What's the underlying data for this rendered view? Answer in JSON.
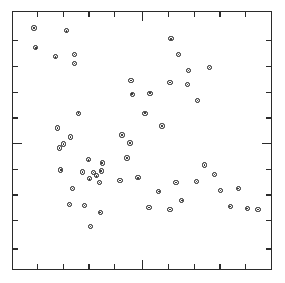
{
  "chart_data": {
    "type": "scatter",
    "title": "",
    "subtitle": "",
    "xlabel": "",
    "ylabel": "",
    "xlim": [
      0,
      100
    ],
    "ylim": [
      0,
      100
    ],
    "grid": false,
    "legend": null,
    "annotations": [],
    "marker": {
      "shape": "circle-open-with-center-dot",
      "color": "#1a1a1a",
      "fill": "#ffffff",
      "size_px": 5.4
    },
    "axes": {
      "frame": "full-box",
      "tick_direction": "inward",
      "tick_labels_shown": false,
      "x_tick_positions": [
        9.2,
        19.2,
        29.2,
        39.2,
        50.0,
        60.0,
        70.0,
        80.0,
        90.0
      ],
      "x_major_tick_positions": [
        50.0
      ],
      "y_tick_positions": [
        8.0,
        19.0,
        29.0,
        39.0,
        49.0,
        59.0,
        69.0,
        79.0,
        89.0
      ],
      "y_major_tick_positions": [
        49.0
      ]
    },
    "n_points": 55,
    "points": [
      {
        "x": 8.1,
        "y": 93.8
      },
      {
        "x": 20.8,
        "y": 92.7
      },
      {
        "x": 8.8,
        "y": 86.1
      },
      {
        "x": 16.5,
        "y": 82.6
      },
      {
        "x": 23.8,
        "y": 83.4
      },
      {
        "x": 23.8,
        "y": 79.9
      },
      {
        "x": 61.2,
        "y": 89.6
      },
      {
        "x": 64.2,
        "y": 83.4
      },
      {
        "x": 68.1,
        "y": 77.2
      },
      {
        "x": 76.2,
        "y": 78.4
      },
      {
        "x": 60.8,
        "y": 72.6
      },
      {
        "x": 67.7,
        "y": 71.8
      },
      {
        "x": 71.5,
        "y": 65.6
      },
      {
        "x": 45.8,
        "y": 73.4
      },
      {
        "x": 46.2,
        "y": 68.0
      },
      {
        "x": 53.1,
        "y": 68.4
      },
      {
        "x": 25.4,
        "y": 60.6
      },
      {
        "x": 57.7,
        "y": 55.6
      },
      {
        "x": 17.3,
        "y": 54.8
      },
      {
        "x": 22.3,
        "y": 51.4
      },
      {
        "x": 19.6,
        "y": 48.6
      },
      {
        "x": 18.1,
        "y": 47.1
      },
      {
        "x": 42.3,
        "y": 52.1
      },
      {
        "x": 45.4,
        "y": 49.0
      },
      {
        "x": 29.2,
        "y": 42.5
      },
      {
        "x": 34.6,
        "y": 41.3
      },
      {
        "x": 18.5,
        "y": 38.6
      },
      {
        "x": 26.9,
        "y": 37.8
      },
      {
        "x": 31.2,
        "y": 37.5
      },
      {
        "x": 34.2,
        "y": 38.2
      },
      {
        "x": 32.3,
        "y": 36.3
      },
      {
        "x": 29.6,
        "y": 35.1
      },
      {
        "x": 33.5,
        "y": 33.6
      },
      {
        "x": 44.2,
        "y": 43.2
      },
      {
        "x": 41.5,
        "y": 34.4
      },
      {
        "x": 23.1,
        "y": 31.3
      },
      {
        "x": 21.9,
        "y": 25.1
      },
      {
        "x": 27.7,
        "y": 24.7
      },
      {
        "x": 33.8,
        "y": 22.0
      },
      {
        "x": 30.0,
        "y": 16.6
      },
      {
        "x": 56.5,
        "y": 30.1
      },
      {
        "x": 52.7,
        "y": 23.9
      },
      {
        "x": 60.8,
        "y": 23.2
      },
      {
        "x": 65.4,
        "y": 26.6
      },
      {
        "x": 63.1,
        "y": 33.6
      },
      {
        "x": 71.2,
        "y": 34.0
      },
      {
        "x": 78.1,
        "y": 36.7
      },
      {
        "x": 80.4,
        "y": 30.5
      },
      {
        "x": 84.2,
        "y": 24.3
      },
      {
        "x": 90.8,
        "y": 23.6
      },
      {
        "x": 87.3,
        "y": 31.3
      },
      {
        "x": 95.0,
        "y": 23.2
      },
      {
        "x": 48.5,
        "y": 35.5
      },
      {
        "x": 51.2,
        "y": 60.6
      },
      {
        "x": 74.2,
        "y": 40.5
      }
    ]
  }
}
